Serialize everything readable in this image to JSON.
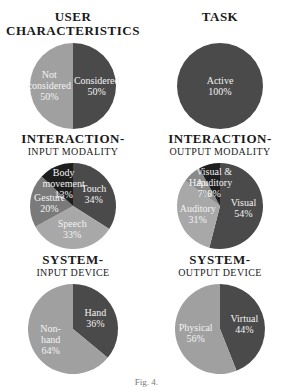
{
  "colors": {
    "dark": "#4a4a4a",
    "black": "#1e1e1e",
    "mid": "#7a7a7a",
    "light": "#9a9a9a",
    "lighter": "#b0b0b0",
    "label": "#f2f2f2"
  },
  "caption": "Fig. 4.",
  "chart_data": [
    {
      "type": "pie",
      "title": "USER",
      "title2": "CHARACTERISTICS",
      "subtitle": "",
      "slices": [
        {
          "label": [
            "Considered"
          ],
          "value": 50,
          "pct": "50%",
          "color": "#4a4a4a"
        },
        {
          "label": [
            "Not",
            "considered"
          ],
          "value": 50,
          "pct": "50%",
          "color": "#a0a0a0"
        }
      ]
    },
    {
      "type": "pie",
      "title": "TASK",
      "title2": "",
      "subtitle": "",
      "slices": [
        {
          "label": [
            "Active"
          ],
          "value": 100,
          "pct": "100%",
          "color": "#4a4a4a"
        }
      ]
    },
    {
      "type": "pie",
      "title": "INTERACTION-",
      "title2": "",
      "subtitle": "INPUT MODALITY",
      "slices": [
        {
          "label": [
            "Touch"
          ],
          "value": 34,
          "pct": "34%",
          "color": "#4a4a4a"
        },
        {
          "label": [
            "Speech"
          ],
          "value": 33,
          "pct": "33%",
          "color": "#a8a8a8"
        },
        {
          "label": [
            "Gesture"
          ],
          "value": 20,
          "pct": "20%",
          "color": "#7a7a7a"
        },
        {
          "label": [
            "Body",
            "movement"
          ],
          "value": 13,
          "pct": "13%",
          "color": "#1e1e1e"
        }
      ]
    },
    {
      "type": "pie",
      "title": "INTERACTION-",
      "title2": "",
      "subtitle": "OUTPUT MODALITY",
      "slices": [
        {
          "label": [
            "Visual"
          ],
          "value": 54,
          "pct": "54%",
          "color": "#4a4a4a"
        },
        {
          "label": [
            "Auditory"
          ],
          "value": 31,
          "pct": "31%",
          "color": "#a8a8a8"
        },
        {
          "label": [
            "Haptics"
          ],
          "value": 7,
          "pct": "7%",
          "color": "#8a8a8a"
        },
        {
          "label": [
            "Visual &",
            "Auditory"
          ],
          "value": 8,
          "pct": "8%",
          "color": "#1e1e1e"
        }
      ]
    },
    {
      "type": "pie",
      "title": "SYSTEM-",
      "title2": "",
      "subtitle": "INPUT DEVICE",
      "slices": [
        {
          "label": [
            "Hand"
          ],
          "value": 36,
          "pct": "36%",
          "color": "#4a4a4a"
        },
        {
          "label": [
            "Non-",
            "hand"
          ],
          "value": 64,
          "pct": "64%",
          "color": "#a0a0a0"
        }
      ]
    },
    {
      "type": "pie",
      "title": "SYSTEM-",
      "title2": "",
      "subtitle": "OUTPUT DEVICE",
      "slices": [
        {
          "label": [
            "Virtual"
          ],
          "value": 44,
          "pct": "44%",
          "color": "#4a4a4a"
        },
        {
          "label": [
            "Physical"
          ],
          "value": 56,
          "pct": "56%",
          "color": "#a0a0a0"
        }
      ]
    }
  ]
}
